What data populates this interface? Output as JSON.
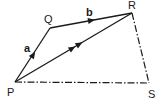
{
  "diagram": {
    "type": "vector-quadrilateral",
    "points": {
      "P": {
        "label": "P",
        "x": 15,
        "y": 82
      },
      "Q": {
        "label": "Q",
        "x": 50,
        "y": 28
      },
      "R": {
        "label": "R",
        "x": 132,
        "y": 13
      },
      "S": {
        "label": "S",
        "x": 149,
        "y": 83
      }
    },
    "edges": [
      {
        "from": "P",
        "to": "Q",
        "style": "solid",
        "arrow": "single",
        "vector_label": "a"
      },
      {
        "from": "Q",
        "to": "R",
        "style": "solid",
        "arrow": "single",
        "vector_label": "b"
      },
      {
        "from": "P",
        "to": "R",
        "style": "solid",
        "arrow": "double",
        "vector_label": ""
      },
      {
        "from": "R",
        "to": "S",
        "style": "dash-dot",
        "arrow": "none",
        "vector_label": ""
      },
      {
        "from": "P",
        "to": "S",
        "style": "dash-dot",
        "arrow": "none",
        "vector_label": ""
      }
    ],
    "vector_labels": {
      "a": "a",
      "b": "b"
    },
    "colors": {
      "line": "#1a1a1a",
      "background": "#ffffff"
    }
  }
}
